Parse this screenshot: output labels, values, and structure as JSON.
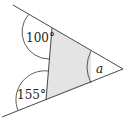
{
  "diagram": {
    "type": "geometry-angles",
    "labels": {
      "angle_top": "100°",
      "angle_bottom": "155°",
      "angle_unknown": "a"
    },
    "colors": {
      "stroke": "#333333",
      "shade": "#e4e4e4",
      "background": "#ffffff"
    }
  }
}
